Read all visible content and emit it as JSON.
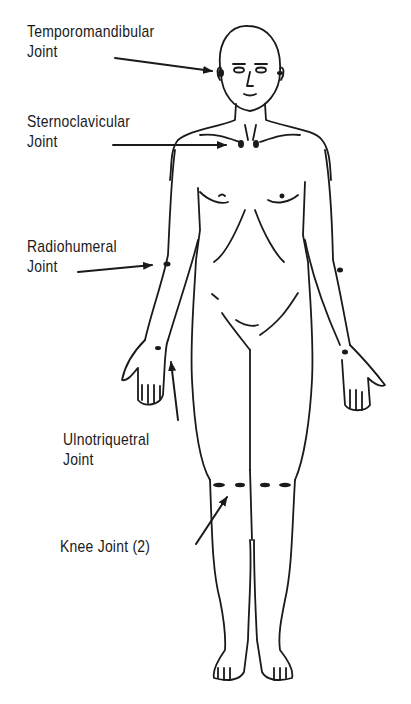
{
  "diagram": {
    "labels": [
      {
        "id": "temporomandibular",
        "line1": "Temporomandibular",
        "line2": "Joint"
      },
      {
        "id": "sternoclavicular",
        "line1": "Sternoclavicular",
        "line2": "Joint"
      },
      {
        "id": "radiohumeral",
        "line1": "Radiohumeral",
        "line2": "Joint"
      },
      {
        "id": "ulnotriquetral",
        "line1": "Ulnotriquetral",
        "line2": "Joint"
      },
      {
        "id": "knee",
        "line1": "Knee Joint (2)",
        "line2": ""
      }
    ],
    "colors": {
      "ink": "#1a1a1a",
      "background": "#ffffff"
    }
  }
}
